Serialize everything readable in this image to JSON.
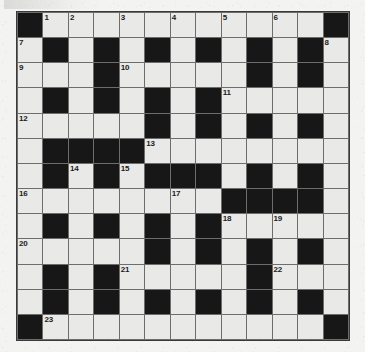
{
  "puzzle": {
    "type": "crossword-grid",
    "rows": 13,
    "columns": 13,
    "colors": {
      "page_background": "#f3f3f1",
      "cell_fill": "#e9e9e7",
      "block_fill": "#171717",
      "grid_line": "#6d6d6d",
      "border": "#3a3a3a",
      "number_text": "#1b1b1b"
    },
    "numbers_present": [
      1,
      2,
      3,
      4,
      5,
      6,
      7,
      8,
      9,
      10,
      11,
      12,
      13,
      14,
      15,
      16,
      17,
      18,
      19,
      20,
      21,
      22,
      23
    ],
    "grid": [
      [
        {
          "block": true,
          "number": ""
        },
        {
          "block": false,
          "number": "1"
        },
        {
          "block": false,
          "number": "2"
        },
        {
          "block": false,
          "number": ""
        },
        {
          "block": false,
          "number": "3"
        },
        {
          "block": false,
          "number": ""
        },
        {
          "block": false,
          "number": "4"
        },
        {
          "block": false,
          "number": ""
        },
        {
          "block": false,
          "number": "5"
        },
        {
          "block": false,
          "number": ""
        },
        {
          "block": false,
          "number": "6"
        },
        {
          "block": false,
          "number": ""
        },
        {
          "block": true,
          "number": ""
        }
      ],
      [
        {
          "block": false,
          "number": "7"
        },
        {
          "block": true,
          "number": ""
        },
        {
          "block": false,
          "number": ""
        },
        {
          "block": true,
          "number": ""
        },
        {
          "block": false,
          "number": ""
        },
        {
          "block": true,
          "number": ""
        },
        {
          "block": false,
          "number": ""
        },
        {
          "block": true,
          "number": ""
        },
        {
          "block": false,
          "number": ""
        },
        {
          "block": true,
          "number": ""
        },
        {
          "block": false,
          "number": ""
        },
        {
          "block": true,
          "number": ""
        },
        {
          "block": false,
          "number": "8"
        }
      ],
      [
        {
          "block": false,
          "number": "9"
        },
        {
          "block": false,
          "number": ""
        },
        {
          "block": false,
          "number": ""
        },
        {
          "block": true,
          "number": ""
        },
        {
          "block": false,
          "number": "10"
        },
        {
          "block": false,
          "number": ""
        },
        {
          "block": false,
          "number": ""
        },
        {
          "block": false,
          "number": ""
        },
        {
          "block": false,
          "number": ""
        },
        {
          "block": true,
          "number": ""
        },
        {
          "block": false,
          "number": ""
        },
        {
          "block": true,
          "number": ""
        },
        {
          "block": false,
          "number": ""
        }
      ],
      [
        {
          "block": false,
          "number": ""
        },
        {
          "block": true,
          "number": ""
        },
        {
          "block": false,
          "number": ""
        },
        {
          "block": true,
          "number": ""
        },
        {
          "block": false,
          "number": ""
        },
        {
          "block": true,
          "number": ""
        },
        {
          "block": false,
          "number": ""
        },
        {
          "block": true,
          "number": ""
        },
        {
          "block": false,
          "number": "11"
        },
        {
          "block": false,
          "number": ""
        },
        {
          "block": false,
          "number": ""
        },
        {
          "block": false,
          "number": ""
        },
        {
          "block": false,
          "number": ""
        }
      ],
      [
        {
          "block": false,
          "number": "12"
        },
        {
          "block": false,
          "number": ""
        },
        {
          "block": false,
          "number": ""
        },
        {
          "block": false,
          "number": ""
        },
        {
          "block": false,
          "number": ""
        },
        {
          "block": true,
          "number": ""
        },
        {
          "block": false,
          "number": ""
        },
        {
          "block": true,
          "number": ""
        },
        {
          "block": false,
          "number": ""
        },
        {
          "block": true,
          "number": ""
        },
        {
          "block": false,
          "number": ""
        },
        {
          "block": true,
          "number": ""
        },
        {
          "block": false,
          "number": ""
        }
      ],
      [
        {
          "block": false,
          "number": ""
        },
        {
          "block": true,
          "number": ""
        },
        {
          "block": true,
          "number": ""
        },
        {
          "block": true,
          "number": ""
        },
        {
          "block": true,
          "number": ""
        },
        {
          "block": false,
          "number": "13"
        },
        {
          "block": false,
          "number": ""
        },
        {
          "block": false,
          "number": ""
        },
        {
          "block": false,
          "number": ""
        },
        {
          "block": false,
          "number": ""
        },
        {
          "block": false,
          "number": ""
        },
        {
          "block": false,
          "number": ""
        },
        {
          "block": false,
          "number": ""
        }
      ],
      [
        {
          "block": false,
          "number": ""
        },
        {
          "block": true,
          "number": ""
        },
        {
          "block": false,
          "number": "14"
        },
        {
          "block": true,
          "number": ""
        },
        {
          "block": false,
          "number": "15"
        },
        {
          "block": true,
          "number": ""
        },
        {
          "block": true,
          "number": ""
        },
        {
          "block": true,
          "number": ""
        },
        {
          "block": false,
          "number": ""
        },
        {
          "block": true,
          "number": ""
        },
        {
          "block": false,
          "number": ""
        },
        {
          "block": true,
          "number": ""
        },
        {
          "block": false,
          "number": ""
        }
      ],
      [
        {
          "block": false,
          "number": "16"
        },
        {
          "block": false,
          "number": ""
        },
        {
          "block": false,
          "number": ""
        },
        {
          "block": false,
          "number": ""
        },
        {
          "block": false,
          "number": ""
        },
        {
          "block": false,
          "number": ""
        },
        {
          "block": false,
          "number": "17"
        },
        {
          "block": false,
          "number": ""
        },
        {
          "block": true,
          "number": ""
        },
        {
          "block": true,
          "number": ""
        },
        {
          "block": true,
          "number": ""
        },
        {
          "block": true,
          "number": ""
        },
        {
          "block": false,
          "number": ""
        }
      ],
      [
        {
          "block": false,
          "number": ""
        },
        {
          "block": true,
          "number": ""
        },
        {
          "block": false,
          "number": ""
        },
        {
          "block": true,
          "number": ""
        },
        {
          "block": false,
          "number": ""
        },
        {
          "block": true,
          "number": ""
        },
        {
          "block": false,
          "number": ""
        },
        {
          "block": true,
          "number": ""
        },
        {
          "block": false,
          "number": "18"
        },
        {
          "block": false,
          "number": ""
        },
        {
          "block": false,
          "number": "19"
        },
        {
          "block": false,
          "number": ""
        },
        {
          "block": false,
          "number": ""
        }
      ],
      [
        {
          "block": false,
          "number": "20"
        },
        {
          "block": false,
          "number": ""
        },
        {
          "block": false,
          "number": ""
        },
        {
          "block": false,
          "number": ""
        },
        {
          "block": false,
          "number": ""
        },
        {
          "block": true,
          "number": ""
        },
        {
          "block": false,
          "number": ""
        },
        {
          "block": true,
          "number": ""
        },
        {
          "block": false,
          "number": ""
        },
        {
          "block": true,
          "number": ""
        },
        {
          "block": false,
          "number": ""
        },
        {
          "block": true,
          "number": ""
        },
        {
          "block": false,
          "number": ""
        }
      ],
      [
        {
          "block": false,
          "number": ""
        },
        {
          "block": true,
          "number": ""
        },
        {
          "block": false,
          "number": ""
        },
        {
          "block": true,
          "number": ""
        },
        {
          "block": false,
          "number": "21"
        },
        {
          "block": false,
          "number": ""
        },
        {
          "block": false,
          "number": ""
        },
        {
          "block": false,
          "number": ""
        },
        {
          "block": false,
          "number": ""
        },
        {
          "block": true,
          "number": ""
        },
        {
          "block": false,
          "number": "22"
        },
        {
          "block": false,
          "number": ""
        },
        {
          "block": false,
          "number": ""
        }
      ],
      [
        {
          "block": false,
          "number": ""
        },
        {
          "block": true,
          "number": ""
        },
        {
          "block": false,
          "number": ""
        },
        {
          "block": true,
          "number": ""
        },
        {
          "block": false,
          "number": ""
        },
        {
          "block": true,
          "number": ""
        },
        {
          "block": false,
          "number": ""
        },
        {
          "block": true,
          "number": ""
        },
        {
          "block": false,
          "number": ""
        },
        {
          "block": true,
          "number": ""
        },
        {
          "block": false,
          "number": ""
        },
        {
          "block": true,
          "number": ""
        },
        {
          "block": false,
          "number": ""
        }
      ],
      [
        {
          "block": true,
          "number": ""
        },
        {
          "block": false,
          "number": "23"
        },
        {
          "block": false,
          "number": ""
        },
        {
          "block": false,
          "number": ""
        },
        {
          "block": false,
          "number": ""
        },
        {
          "block": false,
          "number": ""
        },
        {
          "block": false,
          "number": ""
        },
        {
          "block": false,
          "number": ""
        },
        {
          "block": false,
          "number": ""
        },
        {
          "block": false,
          "number": ""
        },
        {
          "block": false,
          "number": ""
        },
        {
          "block": false,
          "number": ""
        },
        {
          "block": true,
          "number": ""
        }
      ]
    ]
  }
}
